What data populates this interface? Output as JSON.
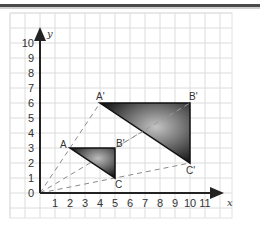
{
  "figure": {
    "grid": {
      "x_min": -2,
      "x_max": 12.8,
      "y_min": -1.7,
      "y_max": 12.2,
      "pitch": 1
    },
    "axes": {
      "x_label": "x",
      "y_label": "y",
      "x_ticks": [
        "1",
        "2",
        "3",
        "4",
        "5",
        "6",
        "7",
        "8",
        "9",
        "10",
        "11"
      ],
      "y_ticks": [
        "1",
        "2",
        "3",
        "4",
        "5",
        "6",
        "7",
        "8",
        "9",
        "10"
      ],
      "origin_label": "0"
    },
    "triangles": [
      {
        "name": "ABC",
        "vertices": [
          {
            "label": "A",
            "x": 2,
            "y": 3
          },
          {
            "label": "B'",
            "x": 5,
            "y": 3
          },
          {
            "label": "C",
            "x": 5,
            "y": 1
          }
        ]
      },
      {
        "name": "A'B'C'",
        "vertices": [
          {
            "label": "A'",
            "x": 4,
            "y": 6
          },
          {
            "label": "B'",
            "x": 10,
            "y": 6
          },
          {
            "label": "C'",
            "x": 10,
            "y": 2
          }
        ]
      }
    ],
    "rays": [
      {
        "from": [
          0,
          0
        ],
        "to": [
          4,
          6
        ]
      },
      {
        "from": [
          0,
          0
        ],
        "to": [
          10,
          6
        ]
      },
      {
        "from": [
          0,
          0
        ],
        "to": [
          10,
          2
        ]
      }
    ],
    "colors": {
      "grid": "#dcdcdc",
      "axis": "#222222",
      "fill_dark": "#111111",
      "fill_light": "#bdbdbd",
      "ray": "#888888"
    }
  }
}
